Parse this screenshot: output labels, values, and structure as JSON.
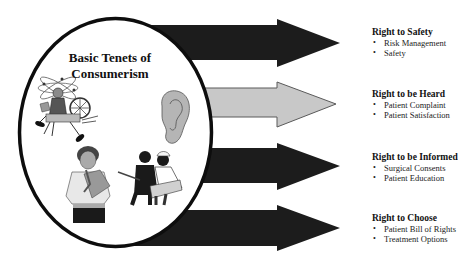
{
  "hub": {
    "title_line1": "Basic Tenets of",
    "title_line2": "Consumerism",
    "illustrations": [
      "juggling-person-icon",
      "ear-icon",
      "distressed-woman-icon",
      "nurse-and-person-reading-icon"
    ]
  },
  "colors": {
    "dark_arrow": "#1c1c1c",
    "light_arrow": "#c8c8c8",
    "light_arrow_border": "#5a5a5a",
    "ellipse_border": "#0d0d0d",
    "ellipse_fill": "#ffffff"
  },
  "rights": [
    {
      "title": "Right to Safety",
      "arrow_style": "dark",
      "items": [
        "Risk Management",
        "Safety"
      ]
    },
    {
      "title": "Right to be Heard",
      "arrow_style": "light",
      "items": [
        "Patient Complaint",
        "Patient Satisfaction"
      ]
    },
    {
      "title": "Right to be Informed",
      "arrow_style": "dark",
      "items": [
        "Surgical Consents",
        "Patient Education"
      ]
    },
    {
      "title": "Right to Choose",
      "arrow_style": "dark",
      "items": [
        "Patient Bill of Rights",
        "Treatment Options"
      ]
    }
  ],
  "bullet_glyph": "•"
}
